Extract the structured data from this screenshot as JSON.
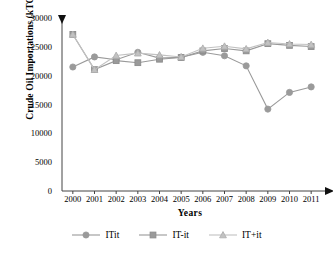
{
  "chart_data": {
    "type": "line",
    "title": "",
    "xlabel": "Years",
    "ylabel": "Crude Oil Importations (kTOE)",
    "categories": [
      2000,
      2001,
      2002,
      2003,
      2004,
      2005,
      2006,
      2007,
      2008,
      2009,
      2010,
      2011
    ],
    "xlim": [
      1999.5,
      2011.5
    ],
    "ylim": [
      0,
      30000
    ],
    "ytick_labels": [
      "0",
      "5000",
      "10000",
      "15000",
      "20000",
      "25000",
      "30000"
    ],
    "yticks": [
      0,
      5000,
      10000,
      15000,
      20000,
      25000,
      30000
    ],
    "xtick_labels": [
      "2000",
      "2001",
      "2002",
      "2003",
      "2004",
      "2005",
      "2006",
      "2007",
      "2008",
      "2009",
      "2010",
      "2011"
    ],
    "grid": false,
    "legend_position": "bottom",
    "series": [
      {
        "name": "ITit",
        "marker": "circle",
        "color": "#9a9a9a",
        "values": [
          21500,
          23250,
          22750,
          24050,
          23050,
          23200,
          24050,
          23450,
          21700,
          14200,
          17100,
          18050
        ]
      },
      {
        "name": "IT-it",
        "marker": "square",
        "color": "#9a9a9a",
        "values": [
          27150,
          21050,
          22600,
          22250,
          22850,
          23150,
          24300,
          24700,
          24300,
          25550,
          25250,
          25050
        ]
      },
      {
        "name": "IT+it",
        "marker": "triangle",
        "color": "#c2c2c2",
        "values": [
          27150,
          21050,
          23500,
          23900,
          23600,
          23250,
          24750,
          25100,
          24650,
          25750,
          25500,
          25400
        ]
      }
    ]
  },
  "axes": {
    "y_arrow": "triangle-up-marker",
    "x_arrow": "triangle-right-marker"
  },
  "colors": {
    "axis": "#444444",
    "series_dark": "#9a9a9a",
    "series_light": "#c2c2c2",
    "text": "#000000"
  }
}
